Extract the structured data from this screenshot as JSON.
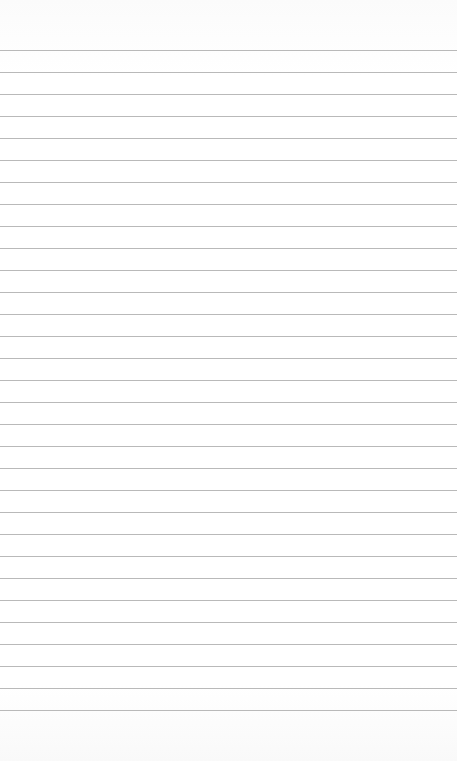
{
  "page": {
    "type": "lined-paper",
    "background_color": "#fdfdfd",
    "rule_color": "#b9b9b9",
    "first_rule_y": 50,
    "rule_spacing": 22,
    "rule_count": 31,
    "text": ""
  }
}
